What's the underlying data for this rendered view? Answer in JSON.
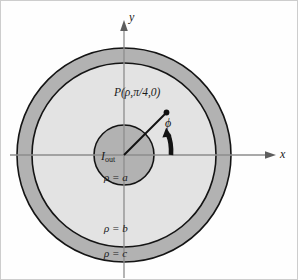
{
  "figure": {
    "name": "coaxial-cable-cross-section",
    "background_color": "#fefefe",
    "border_color": "#c8c8c8"
  },
  "axes": {
    "y_label": "y",
    "x_label": "x",
    "line_color": "#8a8a8a",
    "origin": {
      "x": 124,
      "y": 155
    }
  },
  "regions": {
    "inner_conductor": {
      "label": "ρ = a",
      "radius": 30,
      "fill": "#b0b0b0",
      "stroke": "#111111"
    },
    "dielectric": {
      "label": "ρ = b",
      "radius": 92,
      "fill": "#e2e2e2",
      "stroke": "#111111"
    },
    "outer_conductor": {
      "label": "ρ = c",
      "radius": 107,
      "fill": "#b0b0b0",
      "stroke": "#111111"
    }
  },
  "annotations": {
    "point_label": "P(ρ,π/4,0)",
    "current_label_symbol": "I",
    "current_label_subscript": "out",
    "angle_label": "ϕ",
    "radial_line_angle_deg": 45,
    "point_marker_color": "#111111"
  }
}
